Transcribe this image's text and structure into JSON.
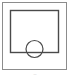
{
  "figure": {
    "canvas": {
      "width": 70,
      "height": 77,
      "background": "#ffffff"
    },
    "outer_frame": {
      "name": "outer-frame",
      "x": 2.5,
      "y": 2.5,
      "width": 64,
      "height": 67,
      "stroke": "#8c8c8c",
      "stroke_width": 1,
      "fill": "#ffffff"
    },
    "inner_rect": {
      "name": "inner-rectangle",
      "x": 10.5,
      "y": 10.5,
      "width": 48,
      "height": 42,
      "stroke": "#4a4a4a",
      "stroke_width": 1.4,
      "fill": "none"
    },
    "circle": {
      "name": "circle",
      "cx": 34.5,
      "cy": 49,
      "r": 8.5,
      "stroke": "#4a4a4a",
      "stroke_width": 1.2,
      "fill": "none"
    },
    "caption": {
      "text": "—",
      "x": 35,
      "y": 75,
      "color": "#b9b9b9"
    }
  }
}
